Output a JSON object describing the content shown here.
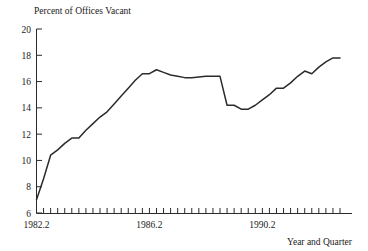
{
  "chart_data": {
    "type": "line",
    "title": "Percent of Offices Vacant",
    "xlabel": "Year and Quarter",
    "ylabel": "",
    "ylim": [
      6,
      20
    ],
    "y_ticks": [
      6,
      8,
      10,
      12,
      14,
      16,
      18,
      20
    ],
    "y_tick_labels": [
      "6",
      "8",
      "10",
      "12",
      "14",
      "16",
      "18",
      "20"
    ],
    "x_tick_labels": [
      "1982.2",
      "1986.2",
      "1990.2"
    ],
    "x_tick_positions": [
      1982.2,
      1986.2,
      1990.2
    ],
    "x_minor_ticks_per_label": 16,
    "grid": false,
    "legend": null,
    "line_color": "#2b2b2b",
    "x": [
      "1982.2",
      "1982.3",
      "1982.4",
      "1983.1",
      "1983.2",
      "1983.3",
      "1983.4",
      "1984.1",
      "1984.2",
      "1984.3",
      "1984.4",
      "1985.1",
      "1985.2",
      "1985.3",
      "1985.4",
      "1986.1",
      "1986.2",
      "1986.3",
      "1986.4",
      "1987.1",
      "1987.2",
      "1987.3",
      "1987.4",
      "1988.1",
      "1988.2",
      "1988.3",
      "1988.4",
      "1989.1",
      "1989.2",
      "1989.3",
      "1989.4",
      "1990.1",
      "1990.2",
      "1990.3",
      "1990.4",
      "1991.1",
      "1991.2",
      "1991.3",
      "1991.4",
      "1992.1",
      "1992.2",
      "1992.3",
      "1992.4",
      "1993.1"
    ],
    "values": [
      7.0,
      8.6,
      10.4,
      10.8,
      11.3,
      11.7,
      11.7,
      12.3,
      12.8,
      13.3,
      13.7,
      14.3,
      14.9,
      15.5,
      16.1,
      16.6,
      16.6,
      16.9,
      16.7,
      16.5,
      16.4,
      16.3,
      16.3,
      16.35,
      16.4,
      16.4,
      16.4,
      14.2,
      14.2,
      13.9,
      13.9,
      14.2,
      14.6,
      15.0,
      15.5,
      15.5,
      15.9,
      16.4,
      16.8,
      16.6,
      17.1,
      17.5,
      17.8,
      17.8
    ]
  },
  "axes": {
    "y_axis_name": "percent-of-offices-vacant",
    "x_axis_name": "year-and-quarter"
  }
}
